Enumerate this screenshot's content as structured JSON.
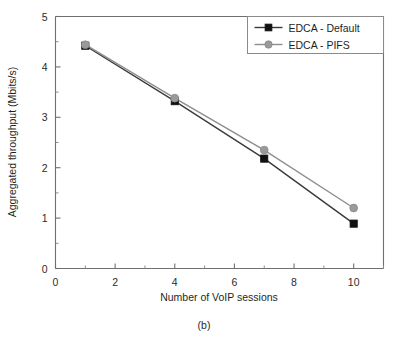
{
  "figure": {
    "caption": "(b)"
  },
  "chart_data": {
    "type": "line",
    "title": "",
    "xlabel": "Number of VoIP sessions",
    "ylabel": "Aggregated throughput (Mbits/s)",
    "x": [
      1,
      4,
      7,
      10
    ],
    "series": [
      {
        "name": "EDCA - Default",
        "marker": "square",
        "color": "#111111",
        "values": [
          4.42,
          3.32,
          2.18,
          0.89
        ]
      },
      {
        "name": "EDCA - PIFS",
        "marker": "circle",
        "color": "#9a9a9a",
        "values": [
          4.44,
          3.38,
          2.35,
          1.2
        ]
      }
    ],
    "xlim": [
      0,
      11
    ],
    "ylim": [
      0,
      5
    ],
    "xticks": [
      0,
      2,
      4,
      6,
      8,
      10
    ],
    "xticklabels": [
      "0",
      "2",
      "4",
      "6",
      "8",
      "10"
    ],
    "xminorticks": [
      1,
      3,
      5,
      7,
      9,
      11
    ],
    "yticks": [
      0,
      1,
      2,
      3,
      4,
      5
    ],
    "yticklabels": [
      "0",
      "1",
      "2",
      "3",
      "4",
      "5"
    ],
    "yminorticks": [
      0.5,
      1.5,
      2.5,
      3.5,
      4.5
    ],
    "grid": false,
    "legend_position": "upper right",
    "legend_entries": [
      "EDCA - Default",
      "EDCA - PIFS"
    ]
  }
}
